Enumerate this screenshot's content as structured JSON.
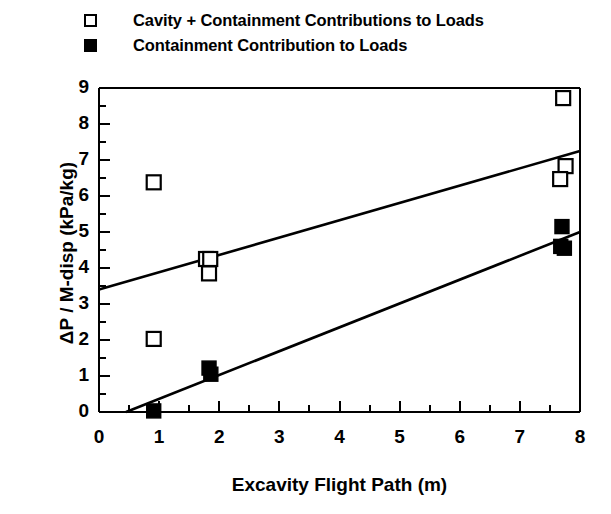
{
  "legend": {
    "position": "top-left-above-axes",
    "entries": [
      {
        "marker": "open-square",
        "label": "Cavity + Containment Contributions to Loads"
      },
      {
        "marker": "filled-square",
        "label": "Containment Contribution to Loads"
      }
    ]
  },
  "axes": {
    "x": {
      "title": "Excavity Flight Path (m)",
      "ticks": [
        "0",
        "1",
        "2",
        "3",
        "4",
        "5",
        "6",
        "7",
        "8"
      ],
      "minor_tick_step": 0.5,
      "range": [
        0,
        8
      ]
    },
    "y": {
      "title": "ΔP / M-disp (kPa/kg)",
      "ticks": [
        "0",
        "1",
        "2",
        "3",
        "4",
        "5",
        "6",
        "7",
        "8",
        "9"
      ],
      "minor_tick_step": 0.5,
      "range": [
        0,
        9
      ]
    }
  },
  "colors": {
    "foreground": "#000000",
    "background": "#ffffff",
    "marker_open_fill": "#ffffff",
    "marker_filled_fill": "#000000",
    "trendline": "#000000"
  },
  "chart_data": {
    "type": "scatter",
    "title": "",
    "xlabel": "Excavity Flight Path (m)",
    "ylabel": "ΔP / M-disp (kPa/kg)",
    "xlim": [
      0,
      8
    ],
    "ylim": [
      0,
      9
    ],
    "xticks": [
      0,
      1,
      2,
      3,
      4,
      5,
      6,
      7,
      8
    ],
    "yticks": [
      0,
      1,
      2,
      3,
      4,
      5,
      6,
      7,
      8,
      9
    ],
    "grid": false,
    "legend_position": "above-plot-left",
    "series": [
      {
        "name": "Cavity + Containment Contributions to Loads",
        "marker": "open-square",
        "points": [
          {
            "x": 0.91,
            "y": 6.38
          },
          {
            "x": 0.91,
            "y": 2.03
          },
          {
            "x": 1.78,
            "y": 4.25
          },
          {
            "x": 1.85,
            "y": 4.25
          },
          {
            "x": 1.83,
            "y": 3.85
          },
          {
            "x": 7.72,
            "y": 8.72
          },
          {
            "x": 7.76,
            "y": 6.83
          },
          {
            "x": 7.67,
            "y": 6.47
          }
        ]
      },
      {
        "name": "Containment Contribution to Loads",
        "marker": "filled-square",
        "points": [
          {
            "x": 0.91,
            "y": 0.03
          },
          {
            "x": 1.83,
            "y": 1.22
          },
          {
            "x": 1.86,
            "y": 1.05
          },
          {
            "x": 7.7,
            "y": 5.15
          },
          {
            "x": 7.68,
            "y": 4.6
          },
          {
            "x": 7.74,
            "y": 4.55
          }
        ]
      }
    ],
    "trendlines": [
      {
        "name": "Cavity + Containment trend",
        "x_start": 0.0,
        "y_start": 3.4,
        "x_end": 8.0,
        "y_end": 7.25
      },
      {
        "name": "Containment trend",
        "x_start": 0.45,
        "y_start": 0.0,
        "x_end": 8.0,
        "y_end": 5.0
      }
    ]
  }
}
